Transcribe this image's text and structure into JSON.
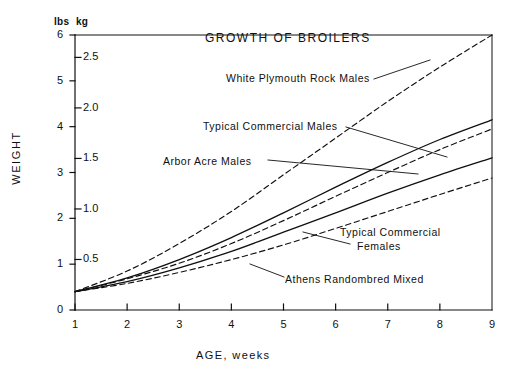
{
  "figure": {
    "units_left_label": "lbs",
    "units_right_label": "kg",
    "y_axis_title": "WEIGHT",
    "x_axis_title": "AGE, weeks"
  },
  "chart_data": {
    "type": "line",
    "title": "GROWTH OF BROILERS",
    "xlabel": "AGE, weeks",
    "ylabel": "WEIGHT",
    "y_unit_primary": "lbs",
    "y_unit_secondary": "kg",
    "xlim": [
      1,
      9
    ],
    "ylim_lbs": [
      0,
      6
    ],
    "ylim_kg": [
      0,
      2.72
    ],
    "grid": false,
    "legend": "inline-annotations",
    "x_ticks": [
      1,
      2,
      3,
      4,
      5,
      6,
      7,
      8,
      9
    ],
    "x_tick_labels": [
      "1",
      "2",
      "3",
      "4",
      "5",
      "6",
      "7",
      "8",
      "9"
    ],
    "y_ticks_lbs": [
      0,
      1,
      2,
      3,
      4,
      5,
      6
    ],
    "y_tick_labels_lbs": [
      "0",
      "1",
      "2",
      "3",
      "4",
      "5",
      "6"
    ],
    "y_ticks_kg": [
      0.5,
      1.0,
      1.5,
      2.0,
      2.5
    ],
    "y_tick_labels_kg": [
      "0.5",
      "1.0",
      "1.5",
      "2.0",
      "2.5"
    ],
    "x": [
      1,
      2,
      3,
      4,
      5,
      6,
      7,
      8,
      9
    ],
    "series": [
      {
        "name": "White Plymouth Rock Males",
        "style": "dashed",
        "unit": "lbs",
        "values": [
          0.4,
          0.85,
          1.45,
          2.15,
          2.95,
          3.75,
          4.55,
          5.3,
          6.0
        ]
      },
      {
        "name": "Typical Commercial Males",
        "style": "solid",
        "unit": "lbs",
        "values": [
          0.4,
          0.7,
          1.1,
          1.58,
          2.12,
          2.68,
          3.22,
          3.72,
          4.15
        ]
      },
      {
        "name": "Arbor Acre Males",
        "style": "dashed",
        "unit": "lbs",
        "values": [
          0.4,
          0.68,
          1.02,
          1.45,
          1.95,
          2.48,
          3.0,
          3.5,
          3.95
        ]
      },
      {
        "name": "Typical Commercial Females",
        "style": "solid",
        "unit": "lbs",
        "values": [
          0.4,
          0.62,
          0.92,
          1.28,
          1.7,
          2.12,
          2.55,
          2.95,
          3.32
        ]
      },
      {
        "name": "Athens Randombred Mixed",
        "style": "dashed",
        "unit": "lbs",
        "values": [
          0.4,
          0.58,
          0.82,
          1.1,
          1.42,
          1.78,
          2.15,
          2.52,
          2.88
        ]
      }
    ],
    "annotations": [
      {
        "text": "White Plymouth Rock Males",
        "target_series": "White Plymouth Rock Males"
      },
      {
        "text": "Typical Commercial Males",
        "target_series": "Typical Commercial Males"
      },
      {
        "text": "Arbor Acre Males",
        "target_series": "Arbor Acre Males"
      },
      {
        "text": "Typical Commercial",
        "text_line2": "Females",
        "target_series": "Typical Commercial Females"
      },
      {
        "text": "Athens Randombred Mixed",
        "target_series": "Athens Randombred Mixed"
      }
    ]
  },
  "colors": {
    "ink": "#101010",
    "background": "#ffffff"
  }
}
